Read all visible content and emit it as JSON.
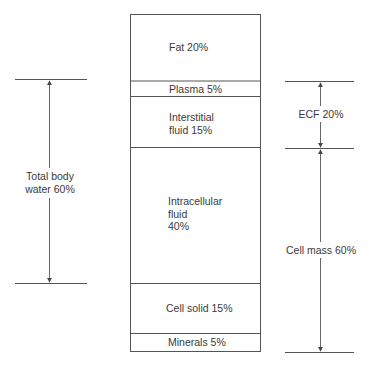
{
  "diagram": {
    "compartments": [
      {
        "id": "fat",
        "label": "Fat 20%",
        "percent": 20
      },
      {
        "id": "plasma",
        "label": "Plasma 5%",
        "percent": 5
      },
      {
        "id": "interstitial",
        "label_lines": [
          "Interstitial",
          "fluid 15%"
        ],
        "percent": 15
      },
      {
        "id": "intracellular",
        "label_lines": [
          "Intracellular",
          "fluid",
          "40%"
        ],
        "percent": 40
      },
      {
        "id": "cell-solid",
        "label": "Cell solid 15%",
        "percent": 15
      },
      {
        "id": "minerals",
        "label": "Minerals 5%",
        "percent": 5
      }
    ],
    "left_brackets": [
      {
        "id": "total-body-water",
        "label_lines": [
          "Total body",
          "water 60%"
        ],
        "spans": [
          "plasma",
          "interstitial",
          "intracellular"
        ]
      }
    ],
    "right_brackets": [
      {
        "id": "ecf",
        "label": "ECF 20%",
        "spans": [
          "plasma",
          "interstitial"
        ]
      },
      {
        "id": "cell-mass",
        "label": "Cell mass 60%",
        "spans": [
          "intracellular",
          "cell-solid",
          "minerals"
        ]
      }
    ],
    "colors": {
      "line": "#555555",
      "text": "#3a3a3a",
      "background": "#ffffff"
    }
  }
}
